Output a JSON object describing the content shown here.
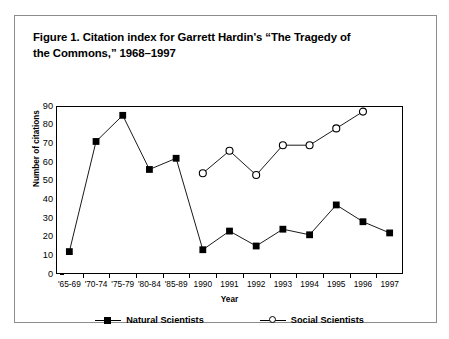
{
  "figure": {
    "title": "Figure 1. Citation index for Garrett Hardin's “The Tragedy of\nthe Commons,” 1968–1997"
  },
  "chart_data": {
    "type": "line",
    "title": "Figure 1. Citation index for Garrett Hardin's “The Tragedy of the Commons,” 1968–1997",
    "xlabel": "Year",
    "ylabel": "Number of citations",
    "categories": [
      "'65-69",
      "'70-74",
      "'75-79",
      "'80-84",
      "'85-89",
      "1990",
      "1991",
      "1992",
      "1993",
      "1994",
      "1995",
      "1996",
      "1997"
    ],
    "ylim": [
      0,
      90
    ],
    "yticks": [
      0,
      10,
      20,
      30,
      40,
      50,
      60,
      70,
      80,
      90
    ],
    "grid": false,
    "legend_position": "bottom",
    "series": [
      {
        "name": "Natural Scientists",
        "marker": "filled-square",
        "values": [
          12,
          71,
          85,
          56,
          62,
          13,
          23,
          15,
          24,
          21,
          37,
          28,
          22
        ]
      },
      {
        "name": "Social Scientists",
        "marker": "open-circle",
        "values": [
          null,
          null,
          null,
          null,
          null,
          54,
          66,
          53,
          69,
          69,
          78,
          87,
          null
        ]
      }
    ]
  },
  "colors": {
    "line": "#000000",
    "frame": "#000000",
    "figure_border": "#8d8d8d",
    "background": "#ffffff"
  }
}
